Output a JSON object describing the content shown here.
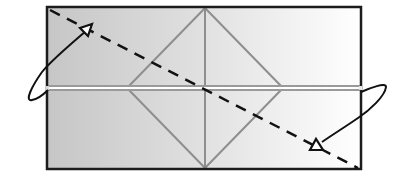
{
  "diagram": {
    "title": "Origami fold diagram",
    "paper": {
      "x": 47,
      "y": 7,
      "width": 314,
      "height": 162,
      "fill_left": "#c9c9c9",
      "fill_right": "#ffffff",
      "border": "#1a1a1a"
    },
    "creases": {
      "color": "#8c8c8c",
      "vertical_center_x": 205,
      "midline_y": 88,
      "diamond": {
        "top": [
          205,
          7
        ],
        "left": [
          127,
          88
        ],
        "right": [
          283,
          88
        ],
        "bottom": [
          205,
          169
        ]
      }
    },
    "valley_fold": {
      "type": "dashed",
      "color": "#111111",
      "from": [
        49,
        9
      ],
      "to": [
        357,
        167
      ]
    },
    "arrows": [
      {
        "name": "top-left-fold-arrow",
        "direction": "fold corner up and over",
        "head": [
          90,
          27
        ]
      },
      {
        "name": "bottom-right-fold-arrow",
        "direction": "fold corner down and over",
        "head": [
          315,
          147
        ]
      }
    ]
  }
}
